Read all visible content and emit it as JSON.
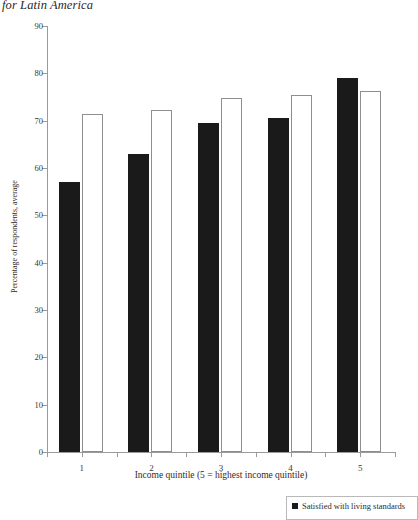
{
  "chart_data": {
    "type": "bar",
    "title": "for Latin America",
    "xlabel": "Income quintile (5 = highest income quintile)",
    "ylabel": "Percentage of respondents, average",
    "categories": [
      "1",
      "2",
      "3",
      "4",
      "5"
    ],
    "ylim": [
      0,
      90
    ],
    "yticks": [
      0,
      10,
      20,
      30,
      40,
      50,
      60,
      70,
      80,
      90
    ],
    "grid": false,
    "legend_position": "bottom-right",
    "series": [
      {
        "name": "Satisfied with living standards",
        "style": "filled-black",
        "color": "#1a1a1a",
        "values": [
          57,
          63,
          69.5,
          70.5,
          79
        ]
      },
      {
        "name": "",
        "style": "open-outline",
        "color": "#ffffff",
        "values": [
          71.5,
          72.3,
          74.8,
          75.4,
          76.2
        ]
      }
    ],
    "legend": [
      {
        "label": "Satisfied with living standards",
        "swatch": "#1a1a1a"
      }
    ]
  }
}
